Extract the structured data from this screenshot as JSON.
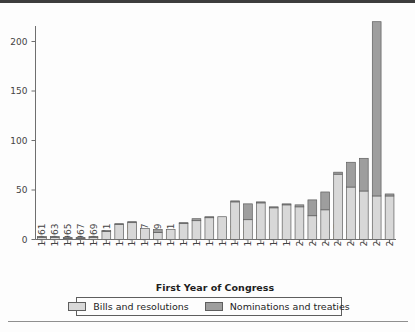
{
  "figure": {
    "background_color": "#fdfdfd",
    "rule_color": "#3d3d3d"
  },
  "legend": {
    "position": "bottom",
    "entries": [
      {
        "key": "bills",
        "label": "Bills and resolutions",
        "color": "#d8d8d8"
      },
      {
        "key": "noms",
        "label": "Nominations and treaties",
        "color": "#9e9e9e"
      }
    ]
  },
  "chart_data": {
    "type": "bar",
    "subtype": "stacked",
    "title": "",
    "xlabel": "First Year of Congress",
    "ylabel": "",
    "grid": false,
    "legend_position": "bottom",
    "ylim": [
      0,
      225
    ],
    "yticks": [
      0,
      50,
      100,
      150,
      200
    ],
    "ytick_labels": [
      "0",
      "50",
      "100",
      "150",
      "200"
    ],
    "categories": [
      "1961",
      "1963",
      "1965",
      "1967",
      "1969",
      "1971",
      "1973",
      "1975",
      "1977",
      "1979",
      "1981",
      "1983",
      "1985",
      "1987",
      "1989",
      "1991",
      "1993",
      "1995",
      "1997",
      "1999",
      "2001",
      "2003",
      "2005",
      "2007",
      "2009",
      "2011",
      "2013",
      "2015"
    ],
    "series": [
      {
        "name": "Bills and resolutions",
        "color": "#d8d8d8",
        "values": [
          2,
          2,
          1,
          1,
          2,
          8,
          15,
          17,
          11,
          7,
          10,
          16,
          19,
          22,
          23,
          38,
          20,
          37,
          32,
          35,
          33,
          24,
          30,
          66,
          53,
          49,
          44,
          44
        ]
      },
      {
        "name": "Nominations and treaties",
        "color": "#9e9e9e",
        "values": [
          1,
          1,
          1,
          1,
          1,
          1,
          1,
          1,
          0,
          3,
          0,
          1,
          2,
          1,
          0,
          1,
          16,
          1,
          1,
          1,
          2,
          16,
          18,
          2,
          25,
          33,
          176,
          2
        ]
      }
    ],
    "totals": [
      3,
      3,
      2,
      2,
      3,
      9,
      16,
      18,
      11,
      10,
      10,
      17,
      21,
      23,
      23,
      39,
      36,
      38,
      33,
      36,
      35,
      40,
      48,
      68,
      78,
      82,
      220,
      46
    ]
  }
}
